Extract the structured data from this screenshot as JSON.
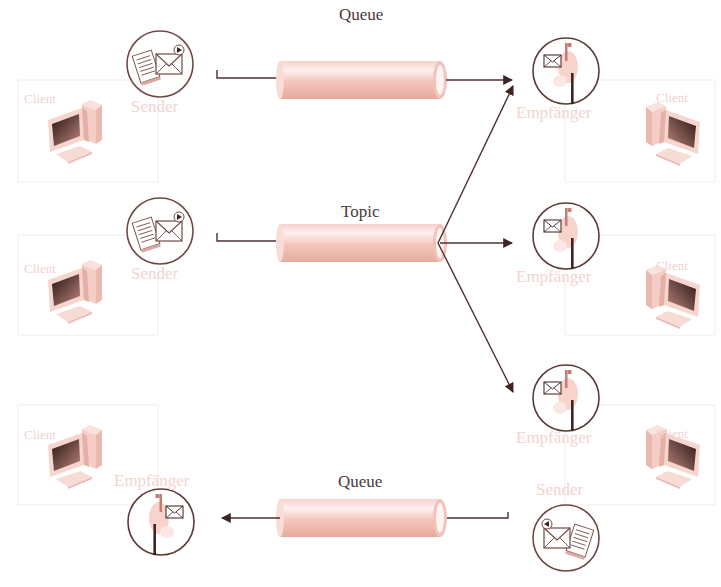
{
  "diagram": {
    "colors": {
      "pipe_light": "#fbe6e2",
      "pipe_dark": "#eab3a8",
      "line": "#4a3030",
      "label_dark": "#4a3b3b",
      "label_faded": "#f2d4d0",
      "icon_stroke": "#6e4a45"
    },
    "channels": [
      {
        "id": "queue-top",
        "label": "Queue",
        "type": "queue"
      },
      {
        "id": "topic",
        "label": "Topic",
        "type": "topic"
      },
      {
        "id": "queue-bottom",
        "label": "Queue",
        "type": "queue"
      }
    ],
    "nodes": {
      "left": [
        {
          "role": "Sender",
          "client": "Client",
          "icon": "sender-icon"
        },
        {
          "role": "Sender",
          "client": "Client",
          "icon": "sender-icon"
        },
        {
          "role": "Empfänger",
          "client": "Client",
          "icon": "receiver-icon"
        }
      ],
      "right": [
        {
          "role": "Empfänger",
          "client": "Client",
          "icon": "receiver-icon"
        },
        {
          "role": "Empfänger",
          "client": "Client",
          "icon": "receiver-icon"
        },
        {
          "role": "Empfänger",
          "client": "Client",
          "icon": "receiver-icon"
        },
        {
          "role": "Sender",
          "client": "",
          "icon": "sender-icon"
        }
      ]
    },
    "edges": [
      {
        "from": "left.0 Sender",
        "via": "Queue",
        "to": "right.0 Empfänger"
      },
      {
        "from": "left.1 Sender",
        "via": "Topic",
        "to": [
          "right.0 Empfänger",
          "right.1 Empfänger",
          "right.2 Empfänger"
        ]
      },
      {
        "from": "right.3 Sender",
        "via": "Queue",
        "to": "left.2 Empfänger"
      }
    ]
  }
}
